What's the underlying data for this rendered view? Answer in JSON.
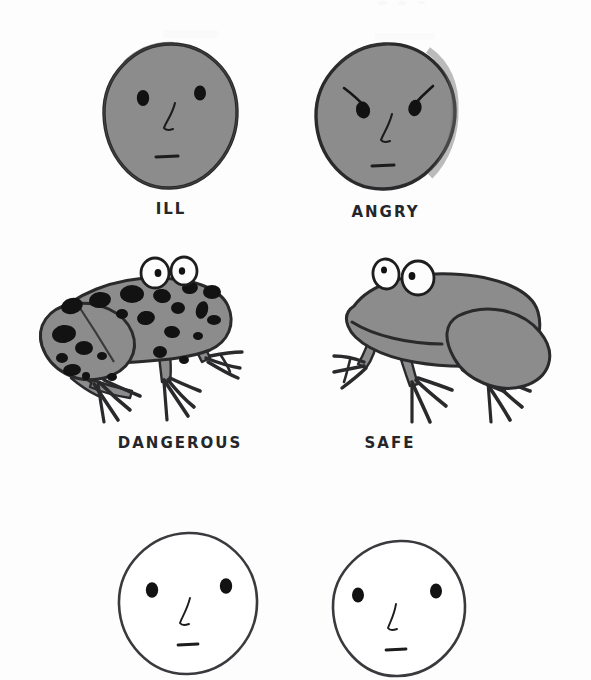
{
  "page": {
    "background_color": "#ffffff",
    "width": 591,
    "height": 680
  },
  "palette": {
    "ink": "#25262a",
    "fill_gray": "#8c8c8c",
    "fill_gray_dark": "#7b7b7b",
    "spot_black": "#121212",
    "paper_white": "#ffffff",
    "eye_white": "#fdfdfd"
  },
  "rows": [
    {
      "name": "faces-row-top",
      "items": [
        {
          "id": "face-ill",
          "kind": "round-face-gray",
          "caption": "ILL",
          "fill": "#8c8c8c",
          "has_eyebrows": false
        },
        {
          "id": "face-angry",
          "kind": "round-face-gray",
          "caption": "ANGRY",
          "fill": "#8c8c8c",
          "has_eyebrows": true
        }
      ]
    },
    {
      "name": "frogs-row-middle",
      "items": [
        {
          "id": "frog-dangerous",
          "kind": "frog-spotted",
          "caption": "DANGEROUS",
          "fill": "#8c8c8c",
          "spots": true,
          "spot_count": 22
        },
        {
          "id": "frog-safe",
          "kind": "frog-plain",
          "caption": "SAFE",
          "fill": "#8c8c8c",
          "spots": false,
          "spot_count": 0
        }
      ]
    },
    {
      "name": "faces-row-bottom",
      "items": [
        {
          "id": "face-blank-left",
          "kind": "round-face-white",
          "caption": "",
          "fill": "#ffffff",
          "has_eyebrows": false
        },
        {
          "id": "face-blank-right",
          "kind": "round-face-white",
          "caption": "",
          "fill": "#ffffff",
          "has_eyebrows": false
        }
      ]
    }
  ],
  "captions": {
    "ill": "ILL",
    "angry": "ANGRY",
    "dangerous": "DANGEROUS",
    "safe": "SAFE"
  }
}
